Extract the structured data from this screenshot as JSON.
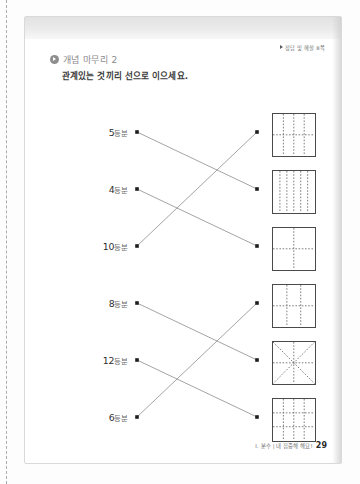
{
  "page": {
    "answer_reference": "정답 및 해설 8쪽",
    "section_label": "개념 마무리 2",
    "instruction": "관계있는 것끼리 선으로 이으세요.",
    "footer_chapter": "I. 분수 | 내 집중해 해요!",
    "page_number": "29"
  },
  "exercise": {
    "type": "matching",
    "left_items": [
      {
        "id": "l1",
        "number": "5",
        "unit": "등분",
        "text": "5등분",
        "parts": 5,
        "dot_x": 112,
        "dot_y": 115
      },
      {
        "id": "l2",
        "number": "4",
        "unit": "등분",
        "text": "4등분",
        "parts": 4,
        "dot_x": 112,
        "dot_y": 172
      },
      {
        "id": "l3",
        "number": "10",
        "unit": "등분",
        "text": "10등분",
        "parts": 10,
        "dot_x": 112,
        "dot_y": 229
      },
      {
        "id": "l4",
        "number": "8",
        "unit": "등분",
        "text": "8등분",
        "parts": 8,
        "dot_x": 112,
        "dot_y": 286
      },
      {
        "id": "l5",
        "number": "12",
        "unit": "등분",
        "text": "12등분",
        "parts": 12,
        "dot_x": 112,
        "dot_y": 343
      },
      {
        "id": "l6",
        "number": "6",
        "unit": "등분",
        "text": "6등분",
        "parts": 6,
        "dot_x": 112,
        "dot_y": 400
      }
    ],
    "right_items": [
      {
        "id": "r1",
        "pattern": "vertical3-horizontal1",
        "parts": 8,
        "verticals": 3,
        "horizontals": 1,
        "diagonals": 0,
        "dot_x": 232,
        "dot_y": 115,
        "fig_x": 247,
        "fig_y": 96
      },
      {
        "id": "r2",
        "pattern": "vertical5",
        "parts": 6,
        "verticals": 5,
        "horizontals": 0,
        "diagonals": 0,
        "dot_x": 232,
        "dot_y": 172,
        "fig_x": 247,
        "fig_y": 153
      },
      {
        "id": "r3",
        "pattern": "vertical1-horizontal1",
        "parts": 4,
        "verticals": 1,
        "horizontals": 1,
        "diagonals": 0,
        "dot_x": 232,
        "dot_y": 229,
        "fig_x": 247,
        "fig_y": 210
      },
      {
        "id": "r4",
        "pattern": "vertical2-horizontal1",
        "parts": 6,
        "verticals": 2,
        "horizontals": 1,
        "diagonals": 0,
        "dot_x": 232,
        "dot_y": 286,
        "fig_x": 247,
        "fig_y": 267
      },
      {
        "id": "r5",
        "pattern": "cross-and-diagonals",
        "parts": 8,
        "verticals": 1,
        "horizontals": 1,
        "diagonals": 2,
        "dot_x": 232,
        "dot_y": 343,
        "fig_x": 247,
        "fig_y": 324
      },
      {
        "id": "r6",
        "pattern": "vertical3-horizontal2",
        "parts": 12,
        "verticals": 3,
        "horizontals": 2,
        "diagonals": 0,
        "dot_x": 232,
        "dot_y": 400,
        "fig_x": 247,
        "fig_y": 381
      }
    ],
    "connections": [
      {
        "from": "l1",
        "to": "r2"
      },
      {
        "from": "l2",
        "to": "r3"
      },
      {
        "from": "l3",
        "to": "r1"
      },
      {
        "from": "l4",
        "to": "r5"
      },
      {
        "from": "l5",
        "to": "r6"
      },
      {
        "from": "l6",
        "to": "r4"
      }
    ]
  },
  "colors": {
    "ink": "#3a3a3a",
    "line": "#8d8d8d",
    "figure_border": "#4a4a4a",
    "dash": "#6f6f6f",
    "muted": "#8a8a8a"
  }
}
